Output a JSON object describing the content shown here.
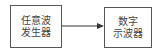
{
  "diagram": {
    "nodes": [
      {
        "id": "generator",
        "lines": [
          "任意波",
          "发生器"
        ]
      },
      {
        "id": "oscilloscope",
        "lines": [
          "数字",
          "示波器"
        ]
      }
    ],
    "edges": [
      {
        "from": "generator",
        "to": "oscilloscope",
        "style": "arrow"
      }
    ],
    "colors": {
      "stroke": "#555555",
      "text": "#444444"
    }
  }
}
